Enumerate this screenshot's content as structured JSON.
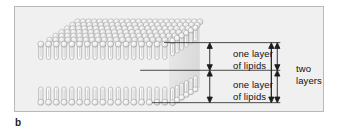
{
  "figure": {
    "panel_letter": "b",
    "background_color": "#f0f0f0",
    "border_color": "#b9b9b9"
  },
  "annotations": {
    "upper_leaflet": {
      "line1": "one layer",
      "line2": "of lipids"
    },
    "lower_leaflet": {
      "line1": "one layer",
      "line2": "of lipids"
    },
    "bilayer": {
      "line1": "two",
      "line2": "layers"
    }
  },
  "structure": {
    "head_color": "#e8e8e8",
    "head_outline": "#8d8d8d",
    "tail_color": "#fbfbfb",
    "tail_outline": "#8a8a8a",
    "top_face_color": "#d8d8d8",
    "leaflets": 2,
    "lipids_per_row_front": 17,
    "depth_rows": 7
  },
  "measures": {
    "arrow_color": "#1d1d1d",
    "leader_color": "#2a2a2a",
    "upper_span_label": "one layer of lipids",
    "lower_span_label": "one layer of lipids",
    "total_span_label": "two layers"
  }
}
